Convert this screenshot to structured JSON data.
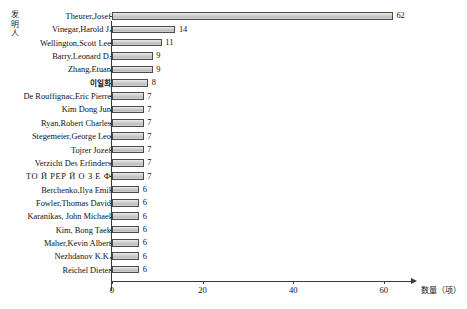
{
  "chart_data": {
    "type": "bar",
    "orientation": "horizontal",
    "title": "",
    "xlabel": "数量（项）",
    "ylabel": "发明人",
    "xlim": [
      0,
      66
    ],
    "grid": false,
    "legend": false,
    "xticks": [
      0,
      20,
      40,
      60
    ],
    "xtick_labels": [
      "0",
      "20",
      "40",
      "60"
    ],
    "categories": [
      "Theurer,Josef",
      "Vinegar,Harold J.",
      "Wellington,Scott Lee",
      "Barry,Leonard D.",
      "Zhang,Etuan",
      "이일희",
      "De Rouffignac,Eric Pierre",
      "Kim Dong Jun",
      "Ryan,Robert Charles",
      "Stegemeier,George Leo",
      "Tojrer Jozef",
      "Verzicht Des Erfinders",
      "ТО Й РЕР Й О З Е Ф",
      "Berchenko,Ilya Emil",
      "Fowler,Thomas David",
      "Karanikas, John Michael",
      "Kim, Bong Taek",
      "Maher,Kevin Albert",
      "Nezhdanov K.K.",
      "Reichel Dieter"
    ],
    "values": [
      62,
      14,
      11,
      9,
      9,
      8,
      7,
      7,
      7,
      7,
      7,
      7,
      7,
      6,
      6,
      6,
      6,
      6,
      6,
      6
    ],
    "value_labels": [
      "62",
      "14",
      "11",
      "9",
      "9",
      "8",
      "7",
      "7",
      "7",
      "7",
      "7",
      "7",
      "7",
      "6",
      "6",
      "6",
      "6",
      "6",
      "6",
      "6"
    ],
    "bar_fill_color": "#cfcfcf",
    "bar_edge_color": "#4d4d4d",
    "axis_color": "#3a3a3a"
  },
  "axis": {
    "y_title_chars": [
      "发",
      "明",
      "人"
    ]
  }
}
